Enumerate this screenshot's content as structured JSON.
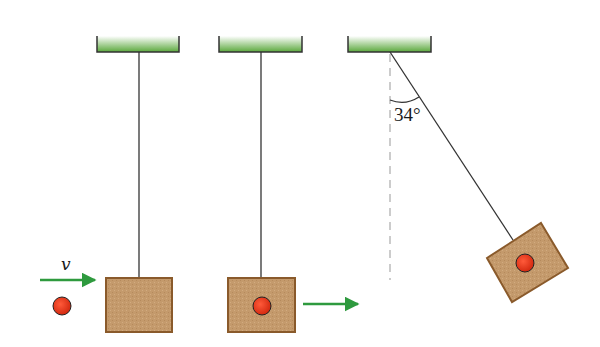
{
  "diagram": {
    "colors": {
      "support_top": "#ffffff",
      "support_bottom": "#5aa83c",
      "support_outline": "#333333",
      "string": "#333333",
      "block_fill": "#c49a6c",
      "block_outline": "#8a5a2b",
      "ball_fill": "#e8341c",
      "ball_outline": "#222222",
      "arrow": "#2e9a3e",
      "dashed_line": "#999999"
    },
    "stages": [
      {
        "id": "before-collision",
        "support": {
          "x": 96,
          "width": 84
        },
        "string": {
          "x": 139,
          "top": 52,
          "bottom": 278
        },
        "block": {
          "x": 106,
          "y": 278,
          "w": 66,
          "h": 54
        },
        "ball": {
          "cx": 62,
          "cy": 306,
          "r": 9
        },
        "velocity_arrow": {
          "x1": 40,
          "x2": 95,
          "y": 280
        },
        "velocity_label": "v"
      },
      {
        "id": "after-collision",
        "support": {
          "x": 218,
          "width": 84
        },
        "string": {
          "x": 261,
          "top": 52,
          "bottom": 278
        },
        "block": {
          "x": 228,
          "y": 278,
          "w": 67,
          "h": 54
        },
        "ball": {
          "cx": 262,
          "cy": 306,
          "r": 9
        },
        "velocity_arrow": {
          "x1": 303,
          "x2": 358,
          "y": 304
        }
      },
      {
        "id": "max-swing",
        "support": {
          "x": 347,
          "width": 84
        },
        "pivot": {
          "x": 390,
          "y": 52
        },
        "string_end": {
          "x": 513,
          "y": 240
        },
        "block_center": {
          "x": 527,
          "y": 263
        },
        "ball": {
          "cx": 525,
          "cy": 263,
          "r": 9
        },
        "angle_label": "34°",
        "angle_degrees": 34
      }
    ]
  }
}
